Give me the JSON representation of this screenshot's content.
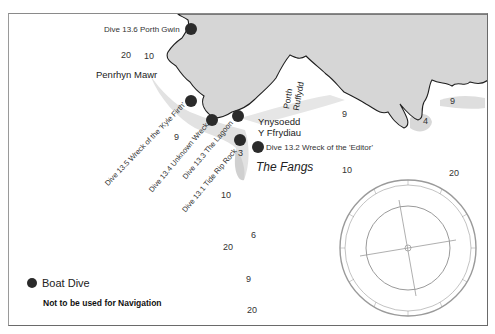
{
  "map": {
    "dive_sites": [
      {
        "id": "13.6",
        "label": "Dive 13.6 Porth Gwin",
        "x": 191,
        "y": 30
      },
      {
        "id": "13.5",
        "label": "Dive 13.5 Wreck of the 'Kyle Firth'",
        "x": 191,
        "y": 101
      },
      {
        "id": "13.4",
        "label": "Dive 13.4 Unknown Wreck",
        "x": 212,
        "y": 120
      },
      {
        "id": "13.3",
        "label": "Dive 13.3 The Lagoon",
        "x": 238,
        "y": 116
      },
      {
        "id": "13.1",
        "label": "Dive 13.1 Tide Rip Rock",
        "x": 240,
        "y": 140
      },
      {
        "id": "13.2",
        "label": "Dive 13.2 Wreck of the 'Editor'",
        "x": 258,
        "y": 147
      }
    ],
    "place_names": [
      {
        "name": "Penrhyn Mawr"
      },
      {
        "name_line1": "Ynysoedd",
        "name_line2": "Y Ffrydiau"
      },
      {
        "name_line1": "Porth",
        "name_line2": "Ruffydd"
      },
      {
        "name": "The Fangs"
      }
    ],
    "depths": [
      {
        "value": "20",
        "x": 121,
        "y": 51
      },
      {
        "value": "10",
        "x": 144,
        "y": 52
      },
      {
        "value": "9",
        "x": 174,
        "y": 133
      },
      {
        "value": "3",
        "x": 238,
        "y": 149
      },
      {
        "value": "9",
        "x": 342,
        "y": 110
      },
      {
        "value": "4",
        "x": 423,
        "y": 117
      },
      {
        "value": "9",
        "x": 450,
        "y": 97
      },
      {
        "value": "10",
        "x": 342,
        "y": 166
      },
      {
        "value": "20",
        "x": 449,
        "y": 169
      },
      {
        "value": "10",
        "x": 221,
        "y": 191
      },
      {
        "value": "6",
        "x": 251,
        "y": 231
      },
      {
        "value": "20",
        "x": 223,
        "y": 243
      },
      {
        "value": "9",
        "x": 246,
        "y": 275
      },
      {
        "value": "20",
        "x": 247,
        "y": 306
      }
    ],
    "legend": {
      "boat_dive_label": "Boat Dive",
      "warning": "Not to be used for Navigation"
    },
    "compass": {
      "cx": 408,
      "cy": 248,
      "outer_radius": 68,
      "inner_radius": 42
    }
  },
  "colors": {
    "land": "#d6d6d6",
    "shallow": "#e4e4e4",
    "coastline": "#1e1e1e",
    "dot": "#2b2b2b",
    "compass": "#9a9a9a"
  }
}
